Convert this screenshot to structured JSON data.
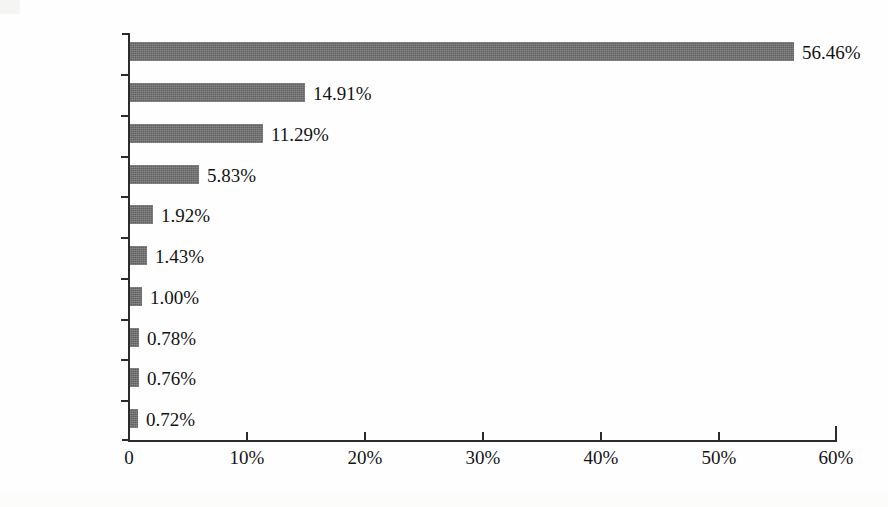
{
  "chart_data": {
    "type": "bar",
    "orientation": "horizontal",
    "title": "",
    "subtitle": "",
    "xlabel": "",
    "ylabel": "",
    "categories": [
      "中国",
      "美国",
      "日本",
      "韩国",
      "德国",
      "中国台湾",
      "印度",
      "法国",
      "英国",
      "荷兰"
    ],
    "values": [
      56.46,
      14.91,
      11.29,
      5.83,
      1.92,
      1.43,
      1.0,
      0.78,
      0.76,
      0.72
    ],
    "data_labels": [
      "56.46%",
      "14.91%",
      "11.29%",
      "5.83%",
      "1.92%",
      "1.43%",
      "1.00%",
      "0.78%",
      "0.76%",
      "0.72%"
    ],
    "xlim": [
      0,
      60
    ],
    "xticks": [
      0,
      10,
      20,
      30,
      40,
      50,
      60
    ],
    "xtick_labels": [
      "0",
      "10%",
      "20%",
      "30%",
      "40%",
      "50%",
      "60%"
    ],
    "grid": false,
    "legend": null,
    "legend_position": "none",
    "bar_color": "#6e6e6e",
    "axis_color": "#2b2b2b",
    "background_color": "#fefefe",
    "series": [
      {
        "name": "",
        "values": [
          56.46,
          14.91,
          11.29,
          5.83,
          1.92,
          1.43,
          1.0,
          0.78,
          0.76,
          0.72
        ]
      }
    ]
  },
  "labels": {
    "cat_0": "中国",
    "cat_1": "美国",
    "cat_2": "日本",
    "cat_3": "韩国",
    "cat_4": "德国",
    "cat_5": "中国台湾",
    "cat_6": "印度",
    "cat_7": "法国",
    "cat_8": "英国",
    "cat_9": "荷兰"
  },
  "values": {
    "val_0": "56.46%",
    "val_1": "14.91%",
    "val_2": "11.29%",
    "val_3": "5.83%",
    "val_4": "1.92%",
    "val_5": "1.43%",
    "val_6": "1.00%",
    "val_7": "0.78%",
    "val_8": "0.76%",
    "val_9": "0.72%"
  },
  "xaxis": {
    "t0": "0",
    "t1": "10%",
    "t2": "20%",
    "t3": "30%",
    "t4": "40%",
    "t5": "50%",
    "t6": "60%"
  }
}
